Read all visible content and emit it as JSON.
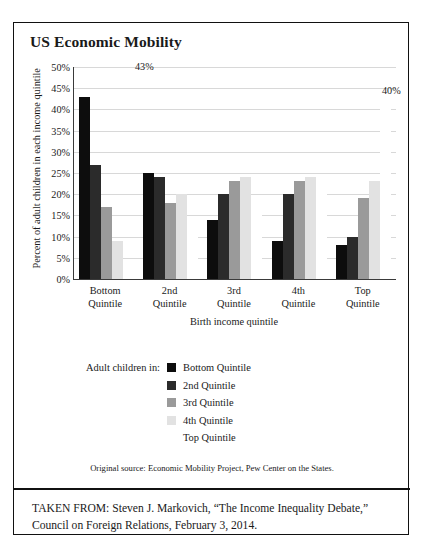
{
  "figure": {
    "title": "US Economic Mobility",
    "source_note": "Original source: Economic Mobility Project, Pew Center on the States.",
    "taken_from_line1": "TAKEN FROM: Steven J. Markovich, “The Income Inequality Debate,”",
    "taken_from_line2": "Council on Foreign Relations, February 3, 2014."
  },
  "legend": {
    "lead_label": "Adult children in:",
    "entries": [
      {
        "label": "Bottom Quintile",
        "color": "#0d0d0d"
      },
      {
        "label": "2nd Quintile",
        "color": "#2b2b2b"
      },
      {
        "label": "3rd Quintile",
        "color": "#9a9a9a"
      },
      {
        "label": "4th Quintile",
        "color": "#e2e2e2"
      },
      {
        "label": "Top Quintile",
        "color": "#ffffff"
      }
    ]
  },
  "annotations": {
    "bottom_peak": "43%",
    "top_peak": "40%"
  },
  "chart_data": {
    "type": "bar",
    "title": "US Economic Mobility",
    "xlabel": "Birth income quintile",
    "ylabel": "Percent of adult children in each income quintile",
    "categories": [
      "Bottom Quintile",
      "2nd Quintile",
      "3rd Quintile",
      "4th Quintile",
      "Top Quintile"
    ],
    "series": [
      {
        "name": "Bottom Quintile",
        "color": "#0d0d0d",
        "values": [
          43,
          25,
          14,
          9,
          8
        ]
      },
      {
        "name": "2nd Quintile",
        "color": "#2b2b2b",
        "values": [
          27,
          24,
          20,
          20,
          10
        ]
      },
      {
        "name": "3rd Quintile",
        "color": "#9a9a9a",
        "values": [
          17,
          18,
          23,
          23,
          19
        ]
      },
      {
        "name": "4th Quintile",
        "color": "#e2e2e2",
        "values": [
          9,
          20,
          24,
          24,
          23
        ]
      },
      {
        "name": "Top Quintile",
        "color": "#ffffff",
        "values": [
          4,
          13,
          19,
          24,
          40
        ]
      }
    ],
    "ylim": [
      0,
      50
    ],
    "yticks": [
      "0%",
      "5%",
      "10%",
      "15%",
      "20%",
      "25%",
      "30%",
      "35%",
      "40%",
      "45%",
      "50%"
    ],
    "ytick_values": [
      0,
      5,
      10,
      15,
      20,
      25,
      30,
      35,
      40,
      45,
      50
    ],
    "grid": true,
    "legend_position": "below-center",
    "data_labels": {
      "Bottom Quintile @ Bottom Quintile": "43%",
      "Top Quintile @ Top Quintile": "40%"
    }
  }
}
